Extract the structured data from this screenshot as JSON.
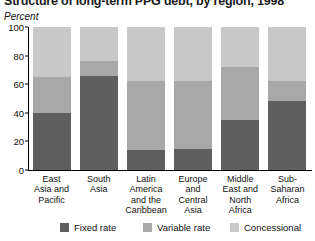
{
  "chart_data": {
    "type": "bar",
    "subtype": "stacked-100-percent",
    "title": "Structure of long-term PPG debt, by region, 1998",
    "ylabel": "Percent",
    "xlabel": "",
    "ylim": [
      0,
      100
    ],
    "yticks": [
      0,
      20,
      40,
      60,
      80,
      100
    ],
    "ytick_labels": [
      "0",
      "20",
      "40",
      "60",
      "80",
      "100"
    ],
    "grid": false,
    "legend_position": "bottom",
    "categories": [
      "East Asia and Pacific",
      "South Asia",
      "Latin America and the Caribbean",
      "Europe and Central Asia",
      "Middle East and North Africa",
      "Sub-Saharan Africa"
    ],
    "category_lines": [
      [
        "East",
        "Asia and",
        "Pacific"
      ],
      [
        "South",
        "Asia"
      ],
      [
        "Latin",
        "America",
        "and the",
        "Caribbean"
      ],
      [
        "Europe",
        "and",
        "Central",
        "Asia"
      ],
      [
        "Middle",
        "East and",
        "North",
        "Africa"
      ],
      [
        "Sub-",
        "Saharan",
        "Africa"
      ]
    ],
    "series": [
      {
        "name": "Fixed rate",
        "color": "#5f5f5f",
        "values": [
          40,
          66,
          14,
          15,
          35,
          48
        ]
      },
      {
        "name": "Variable rate",
        "color": "#a8a8a8",
        "values": [
          25,
          10,
          48,
          47,
          37,
          14
        ]
      },
      {
        "name": "Concessional",
        "color": "#c8c8c8",
        "values": [
          35,
          24,
          38,
          38,
          28,
          38
        ]
      }
    ]
  },
  "colors": {
    "fixed_rate": "#5f5f5f",
    "variable_rate": "#a8a8a8",
    "concessional": "#c8c8c8",
    "axis": "#000000",
    "text": "#111111",
    "background": "#ffffff"
  },
  "legend": {
    "items": [
      {
        "label": "Fixed rate",
        "color": "#5f5f5f"
      },
      {
        "label": "Variable rate",
        "color": "#a8a8a8"
      },
      {
        "label": "Concessional",
        "color": "#c8c8c8"
      }
    ]
  }
}
